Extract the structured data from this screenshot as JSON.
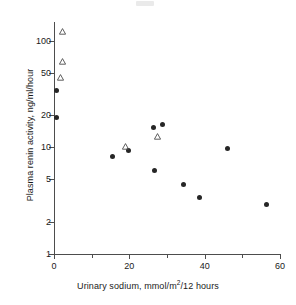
{
  "figure": {
    "top_artifact": "faint-scan-mark"
  },
  "axes": {
    "ylabel": "Plasma renin activity, ng/ml/hour",
    "xlabel_prefix": "Urinary sodium, mmol/m",
    "xlabel_sup": "2",
    "xlabel_suffix": "/12 hours",
    "y_ticks": [
      "100",
      "50",
      "20",
      "10",
      "5",
      "2",
      "1"
    ],
    "x_ticks": [
      "0",
      "20",
      "40",
      "60"
    ]
  },
  "chart_data": {
    "type": "scatter",
    "title": "",
    "xlabel": "Urinary sodium, mmol/m^2/12 hours",
    "ylabel": "Plasma renin activity, ng/ml/hour",
    "xlim": [
      0,
      60
    ],
    "ylim": [
      1,
      150
    ],
    "yscale": "log",
    "xscale": "linear",
    "grid": false,
    "legend": "none",
    "y_tick_values": [
      100,
      50,
      20,
      10,
      5,
      2,
      1
    ],
    "x_tick_values": [
      0,
      20,
      40,
      60
    ],
    "x_minor_tick_values": [
      10,
      30,
      50
    ],
    "series": [
      {
        "name": "filled-circle",
        "marker": "filled circle",
        "color": "#262626",
        "points": [
          {
            "x": 0.6,
            "y": 34
          },
          {
            "x": 0.6,
            "y": 19
          },
          {
            "x": 15.5,
            "y": 8.2
          },
          {
            "x": 19.8,
            "y": 9.3
          },
          {
            "x": 26.5,
            "y": 15.5
          },
          {
            "x": 28.8,
            "y": 16.5
          },
          {
            "x": 26.7,
            "y": 6.1
          },
          {
            "x": 34.5,
            "y": 4.5
          },
          {
            "x": 38.5,
            "y": 3.4
          },
          {
            "x": 46.0,
            "y": 9.7
          },
          {
            "x": 56.3,
            "y": 2.9
          }
        ]
      },
      {
        "name": "open-triangle",
        "marker": "open triangle",
        "color": "#4d4d4d",
        "points": [
          {
            "x": 1.5,
            "y": 120
          },
          {
            "x": 1.5,
            "y": 63
          },
          {
            "x": 0.9,
            "y": 45
          },
          {
            "x": 18.2,
            "y": 10.0
          },
          {
            "x": 26.6,
            "y": 12.5
          }
        ]
      }
    ]
  }
}
